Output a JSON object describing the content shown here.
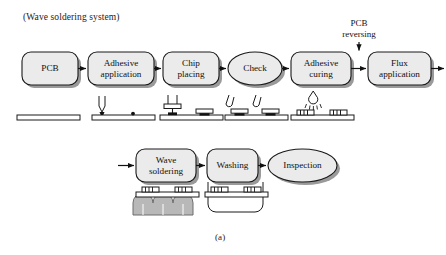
{
  "figure": {
    "title": "(Wave soldering system)",
    "caption": "(a)",
    "type": "process-flow-diagram"
  },
  "colors": {
    "node_fill": "#ebebeb",
    "node_stroke": "#1a1a1a",
    "shadow": "#9a9a9a",
    "arrow": "#111111",
    "wave_fill": "#b8b8b8",
    "board_fill": "#ffffff",
    "chip_fill": "#d9d9d9",
    "text": "#111111",
    "background": "#ffffff"
  },
  "row1": {
    "nodes": [
      {
        "id": "pcb",
        "label": "PCB",
        "shape": "rounded-rect",
        "x": 22,
        "y": 52,
        "w": 56,
        "h": 33
      },
      {
        "id": "adhesive-application",
        "label": "Adhesive\napplication",
        "shape": "rounded-rect",
        "x": 88,
        "y": 52,
        "w": 66,
        "h": 33
      },
      {
        "id": "chip-placing",
        "label": "Chip\nplacing",
        "shape": "rounded-rect",
        "x": 163,
        "y": 52,
        "w": 56,
        "h": 33
      },
      {
        "id": "check",
        "label": "Check",
        "shape": "ellipse",
        "x": 228,
        "y": 52,
        "w": 54,
        "h": 33
      },
      {
        "id": "adhesive-curing",
        "label": "Adhesive\ncuring",
        "shape": "rounded-rect",
        "x": 291,
        "y": 52,
        "w": 60,
        "h": 33
      },
      {
        "id": "flux-application",
        "label": "Flux\napplication",
        "shape": "rounded-rect",
        "x": 368,
        "y": 52,
        "w": 63,
        "h": 33
      }
    ],
    "annotation": {
      "id": "pcb-reversing",
      "label": "PCB\nreversing",
      "x": 329,
      "y": 20
    }
  },
  "row2": {
    "nodes": [
      {
        "id": "wave-soldering",
        "label": "Wave\nsoldering",
        "shape": "rounded-rect",
        "x": 136,
        "y": 149,
        "w": 60,
        "h": 33
      },
      {
        "id": "washing",
        "label": "Washing",
        "shape": "rounded-rect",
        "x": 207,
        "y": 149,
        "w": 51,
        "h": 33
      },
      {
        "id": "inspection",
        "label": "Inspection",
        "shape": "ellipse",
        "x": 268,
        "y": 149,
        "w": 69,
        "h": 33
      }
    ]
  },
  "illustrations": [
    {
      "id": "pcb-bare-board",
      "under": "pcb",
      "parts": "bare board"
    },
    {
      "id": "adhesive-dispenser",
      "under": "adhesive-application",
      "parts": "nozzle, board, adhesive dot"
    },
    {
      "id": "chip-pick-and-place",
      "under": "chip-placing",
      "parts": "placement head, board, chip"
    },
    {
      "id": "check-probes",
      "under": "check",
      "parts": "two angled probes, board with chips"
    },
    {
      "id": "curing-lamp",
      "under": "adhesive-curing",
      "parts": "lamp with rays, inverted board with chips"
    },
    {
      "id": "solder-wave",
      "under": "wave-soldering",
      "parts": "solder wave, inverted board with chips"
    },
    {
      "id": "wash-tank",
      "under": "washing",
      "parts": "tank, inverted board with chips"
    }
  ]
}
